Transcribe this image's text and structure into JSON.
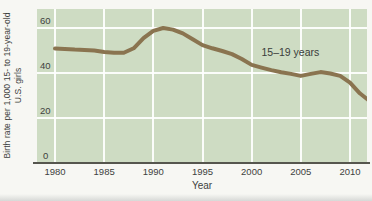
{
  "figure": {
    "y_axis_label_line1": "Birth rate per 1,000 15- to 19-year-old",
    "y_axis_label_line2": "U.S. girls",
    "x_axis_label": "Year",
    "series_label": "15–19 years"
  },
  "colors": {
    "page_background": "#f7f7f3",
    "plot_background": "#cedcc3",
    "gridline": "#ffffff",
    "line": "#8a7450",
    "axis": "#56564e",
    "text": "#3e4240"
  },
  "chart_data": {
    "type": "line",
    "title": "",
    "xlabel": "Year",
    "ylabel": "Birth rate per 1,000 15- to 19-year-old U.S. girls",
    "x_ticks": [
      1980,
      1985,
      1990,
      1995,
      2000,
      2005,
      2010
    ],
    "y_ticks": [
      0,
      20,
      40,
      60
    ],
    "xlim": [
      1978.2,
      2011.7
    ],
    "ylim": [
      0,
      68.5
    ],
    "grid": true,
    "legend": "none",
    "annotation": {
      "text": "15–19 years",
      "x": 2001,
      "y": 49.5
    },
    "series": [
      {
        "name": "15–19 years",
        "x": [
          1980,
          1981,
          1982,
          1983,
          1984,
          1985,
          1986,
          1987,
          1988,
          1989,
          1990,
          1991,
          1992,
          1993,
          1994,
          1995,
          1996,
          1997,
          1998,
          1999,
          2000,
          2001,
          2002,
          2003,
          2004,
          2005,
          2006,
          2007,
          2008,
          2009,
          2010,
          2011,
          2012
        ],
        "values": [
          50.9,
          50.7,
          50.4,
          50.2,
          50.0,
          49.4,
          49.0,
          49.0,
          51.0,
          55.5,
          58.7,
          60.0,
          59.3,
          57.6,
          55.0,
          52.4,
          51.0,
          49.8,
          48.4,
          46.2,
          43.6,
          42.4,
          41.3,
          40.3,
          39.6,
          38.7,
          39.6,
          40.4,
          39.8,
          38.7,
          35.7,
          31.0,
          27.5
        ]
      }
    ]
  }
}
